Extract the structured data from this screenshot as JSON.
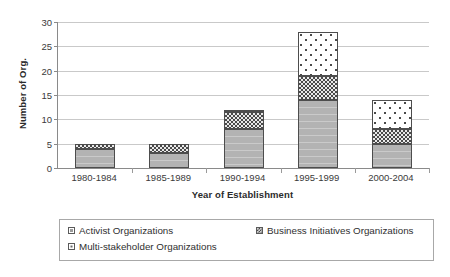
{
  "chart_data": {
    "type": "bar",
    "subtype": "stacked",
    "title": "",
    "xlabel": "Year of Establishment",
    "ylabel": "Number of Org.",
    "categories": [
      "1980-1984",
      "1985-1989",
      "1990-1994",
      "1995-1999",
      "2000-2004"
    ],
    "series": [
      {
        "name": "Activist Organizations",
        "values": [
          4,
          3,
          8,
          14,
          5
        ]
      },
      {
        "name": "Business Initiatives Organizations",
        "values": [
          1,
          2,
          3.5,
          5,
          3
        ]
      },
      {
        "name": "Multi-stakeholder Organizations",
        "values": [
          0,
          0,
          0.5,
          9,
          6
        ]
      }
    ],
    "totals": [
      5,
      5,
      12,
      28,
      14
    ],
    "ylim": [
      0,
      30
    ],
    "yticks": [
      0,
      5,
      10,
      15,
      20,
      25,
      30
    ],
    "ytick_labels": [
      "0",
      "5",
      "10",
      "15",
      "20",
      "25",
      "30"
    ],
    "grid": "horizontal",
    "legend_position": "bottom"
  },
  "axes": {
    "y_title": "Number of Org.",
    "x_title": "Year of Establishment"
  },
  "legend": {
    "items": [
      {
        "label": "Activist Organizations",
        "pattern": "solid-grey"
      },
      {
        "label": "Business Initiatives Organizations",
        "pattern": "dark-checker"
      },
      {
        "label": "Multi-stakeholder Organizations",
        "pattern": "white-dotted"
      }
    ]
  },
  "colors": {
    "activist": "#b3b3b3",
    "business": "#4a4a4a",
    "multi": "#ffffff",
    "gridline": "#c9c9c9",
    "axis": "#8a8a8a",
    "text": "#333333"
  }
}
